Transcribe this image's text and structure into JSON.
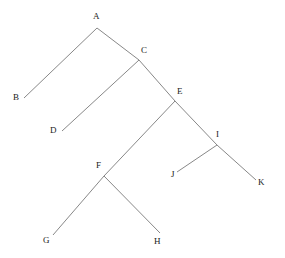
{
  "diagram": {
    "type": "tree",
    "canvas": {
      "width": 285,
      "height": 258
    },
    "style": {
      "background_color": "#ffffff",
      "edge_color": "#888888",
      "edge_width": 1,
      "label_color": "#222222",
      "label_font_size": 9
    },
    "nodes": [
      {
        "id": "A",
        "label": "A",
        "x": 97,
        "y": 28,
        "label_x": 93,
        "label_y": 12,
        "anchor": "above"
      },
      {
        "id": "B",
        "label": "B",
        "x": 24,
        "y": 98,
        "label_x": 13,
        "label_y": 93,
        "anchor": "left"
      },
      {
        "id": "C",
        "label": "C",
        "x": 139,
        "y": 60,
        "label_x": 141,
        "label_y": 46,
        "anchor": "above-right"
      },
      {
        "id": "D",
        "label": "D",
        "x": 62,
        "y": 131,
        "label_x": 50,
        "label_y": 126,
        "anchor": "left"
      },
      {
        "id": "E",
        "label": "E",
        "x": 175,
        "y": 101,
        "label_x": 177,
        "label_y": 87,
        "anchor": "above-right"
      },
      {
        "id": "F",
        "label": "F",
        "x": 104,
        "y": 176,
        "label_x": 96,
        "label_y": 161,
        "anchor": "above-left"
      },
      {
        "id": "G",
        "label": "G",
        "x": 53,
        "y": 235,
        "label_x": 43,
        "label_y": 236,
        "anchor": "below-left"
      },
      {
        "id": "H",
        "label": "H",
        "x": 160,
        "y": 233,
        "label_x": 154,
        "label_y": 237,
        "anchor": "below-right"
      },
      {
        "id": "I",
        "label": "I",
        "x": 217,
        "y": 145,
        "label_x": 216,
        "label_y": 130,
        "anchor": "above-right"
      },
      {
        "id": "J",
        "label": "J",
        "x": 177,
        "y": 172,
        "label_x": 171,
        "label_y": 170,
        "anchor": "below-left"
      },
      {
        "id": "K",
        "label": "K",
        "x": 256,
        "y": 180,
        "label_x": 258,
        "label_y": 178,
        "anchor": "below-right"
      }
    ],
    "edges": [
      {
        "from": "A",
        "to": "B"
      },
      {
        "from": "A",
        "to": "C"
      },
      {
        "from": "C",
        "to": "D"
      },
      {
        "from": "C",
        "to": "E"
      },
      {
        "from": "E",
        "to": "F"
      },
      {
        "from": "E",
        "to": "I"
      },
      {
        "from": "F",
        "to": "G"
      },
      {
        "from": "F",
        "to": "H"
      },
      {
        "from": "I",
        "to": "J"
      },
      {
        "from": "I",
        "to": "K"
      }
    ]
  }
}
